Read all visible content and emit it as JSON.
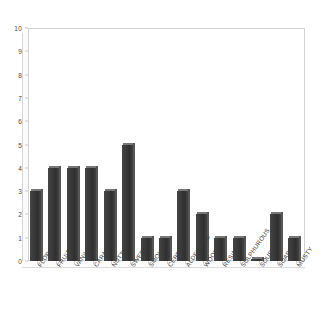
{
  "chart_data": {
    "type": "bar",
    "title": "",
    "subtitle": "",
    "xlabel": "",
    "ylabel": "",
    "ylim": [
      0,
      10
    ],
    "yticks": [
      0,
      1,
      2,
      3,
      4,
      5,
      6,
      7,
      8,
      9,
      10
    ],
    "grid": false,
    "legend": null,
    "categories": [
      "FLORAL",
      "FRUITY",
      "VANILLA",
      "CARAMEL",
      "NUTTY",
      "SWEET",
      "SMOKY",
      "CEREAL",
      "ALDEHYDIC",
      "WOODY",
      "RESINOUS",
      "SULPHUROUS",
      "SOUR",
      "SOAPY",
      "MUSTY"
    ],
    "values": [
      3,
      4,
      4,
      4,
      3,
      5,
      1,
      1,
      3,
      2,
      1,
      1,
      0.1,
      2,
      1
    ],
    "bar_color": "#3b3b3b",
    "bar_top_color": "#787878",
    "frame_color": "#d2d2d2",
    "axis_text_color": "#3a3a3a"
  }
}
